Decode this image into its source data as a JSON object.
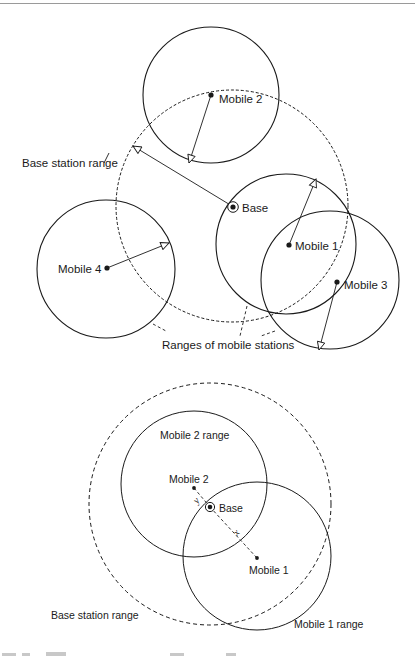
{
  "colors": {
    "stroke": "#1a1a1a",
    "rule": "#9a9a9a",
    "background": "#ffffff"
  },
  "top_diagram": {
    "base": {
      "label": "Base"
    },
    "base_range_label": "Base station range",
    "mobiles": [
      {
        "label": "Mobile 1"
      },
      {
        "label": "Mobile 2"
      },
      {
        "label": "Mobile 3"
      },
      {
        "label": "Mobile 4"
      }
    ],
    "mobile_ranges_label": "Ranges of mobile stations"
  },
  "bottom_diagram": {
    "base": {
      "label": "Base"
    },
    "base_range_label": "Base station range",
    "mobile1": {
      "label": "Mobile 1",
      "range_label": "Mobile 1 range"
    },
    "mobile2": {
      "label": "Mobile 2",
      "range_label": "Mobile 2 range"
    },
    "distance_x": "x",
    "distance_y": "y"
  }
}
